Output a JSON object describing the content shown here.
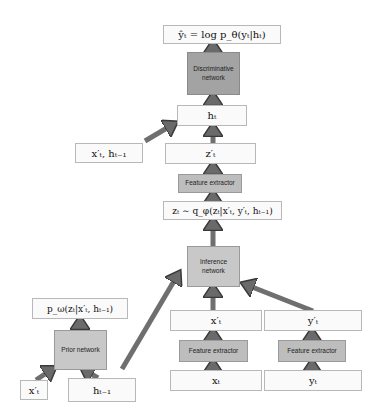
{
  "diagram": {
    "colors": {
      "variable_box_fill": "#fafafa",
      "variable_box_border": "#b8b8b8",
      "discriminative_fill": "#a3a3a3",
      "network_fill": "#c8c8c8",
      "feature_fill": "#bdbdbd",
      "arrow_fill": "#7a7a7a",
      "arrow_stroke": "#4a4a4a"
    },
    "nodes": {
      "output": "ŷₜ = log p_θ(yₜ|hₜ)",
      "discriminative_network": "Discriminative network",
      "h_t": "hₜ",
      "input_pair": "x′ₜ, hₜ₋₁",
      "z_prime": "z′ₜ",
      "feature_extractor_z": "Feature extractor",
      "posterior": "zₜ ∼ q_φ(zₜ|x′ₜ, y′ₜ, hₜ₋₁)",
      "inference_network": "Inference network",
      "prior": "p_ω(zₜ|x′ₜ, hₜ₋₁)",
      "prior_network": "Prior network",
      "x_prime_small": "x′ₜ",
      "h_prev": "hₜ₋₁",
      "x_prime": "x′ₜ",
      "feature_extractor_x": "Feature extractor",
      "x_t": "xₜ",
      "y_prime": "y′ₜ",
      "feature_extractor_y": "Feature extractor",
      "y_t": "yₜ"
    }
  }
}
